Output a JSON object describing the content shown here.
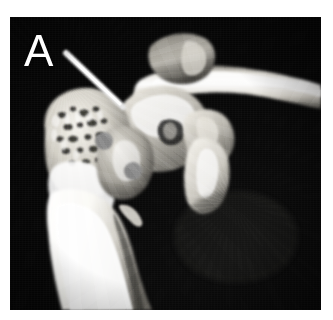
{
  "figure": {
    "panel_label": "A",
    "modality": "3D CT volume reconstruction",
    "view": "shoulder joint, anterior oblique",
    "background_color": "#050505",
    "page_color": "#ffffff",
    "bone_color": "#f2f0ea",
    "label_color": "#ffffff",
    "wire_color": "#ffffff",
    "canvas": {
      "x": 10,
      "y": 17,
      "width": 311,
      "height": 293
    }
  },
  "annotations": {
    "guidewire": {
      "name": "guidewire",
      "label": "",
      "x1": 56,
      "y1": 36,
      "x2": 113,
      "y2": 90,
      "color": "#ffffff",
      "width": 6
    },
    "defects": [
      {
        "name": "cortical-defect-superior",
        "cx": 94,
        "cy": 124,
        "r": 9,
        "color": "#8d8d8d"
      },
      {
        "name": "cortical-defect-inferior",
        "cx": 123,
        "cy": 154,
        "r": 9,
        "color": "#8b8b8b"
      }
    ]
  },
  "structures": [
    {
      "name": "humeral-head",
      "label": "humeral head"
    },
    {
      "name": "humeral-shaft",
      "label": "humeral shaft"
    },
    {
      "name": "greater-tuberosity",
      "label": "greater tuberosity"
    },
    {
      "name": "glenoid",
      "label": "glenoid"
    },
    {
      "name": "coracoid-process",
      "label": "coracoid process"
    },
    {
      "name": "acromion",
      "label": "acromion"
    },
    {
      "name": "clavicle",
      "label": "clavicle"
    },
    {
      "name": "scapular-spine",
      "label": "scapular spine"
    }
  ]
}
